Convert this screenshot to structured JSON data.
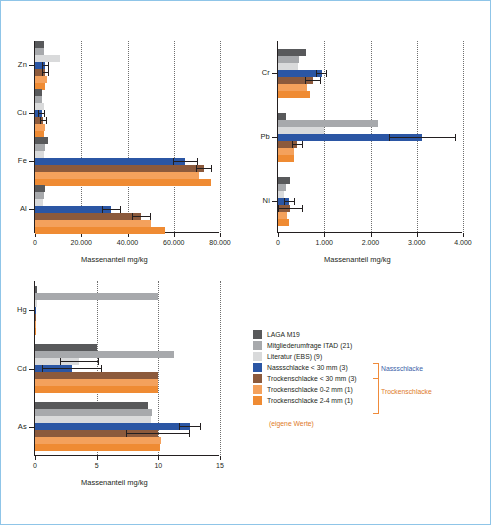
{
  "colors": {
    "dark_gray": "#58595b",
    "mid_gray": "#a7a9ac",
    "light_gray": "#d9dadb",
    "blue": "#2b56a4",
    "brown": "#8c5a3c",
    "orange_light": "#f4a15c",
    "orange": "#ef8b33",
    "hatch_dark": "#6d6e71",
    "brace": "#f08b3a",
    "group_blue": "#3b5fa8",
    "group_orange": "#e07b2a"
  },
  "legend": {
    "items": [
      {
        "label": "LAGA M19",
        "color": "#58595b"
      },
      {
        "label": "Mitgliederumfrage ITAD (21)",
        "color": "#a7a9ac"
      },
      {
        "label": "Literatur (EBS) (9)",
        "color": "#d9dadb"
      },
      {
        "label": "Nassschlacke < 30 mm (3)",
        "color": "#2b56a4"
      },
      {
        "label": "Trockenschlacke < 30 mm (3)",
        "color": "#8c5a3c"
      },
      {
        "label": "Trockenschlacke 0-2 mm (1)",
        "color": "#f4a15c"
      },
      {
        "label": "Trockenschlacke 2-4 mm (1)",
        "color": "#ef8b33"
      }
    ],
    "group_labels": {
      "wet": "Nassschlacke",
      "dry": "Trockenschlacke"
    },
    "note": "(eigene Werte)"
  },
  "chart_data": [
    {
      "type": "bar",
      "id": "chart-top-left",
      "orientation": "horizontal",
      "xlabel": "Massenanteil  mg/kg",
      "ylabel": "",
      "xlim": [
        0,
        80000
      ],
      "xticks": [
        0,
        20000,
        40000,
        60000,
        80000
      ],
      "xticklabels": [
        "0",
        "20.000",
        "40.000",
        "60.000",
        "80.000"
      ],
      "categories": [
        "Zn",
        "Cu",
        "Fe",
        "Al"
      ],
      "grid": true,
      "series": [
        {
          "name": "LAGA M19",
          "color": "#58595b",
          "values": [
            4000,
            3000,
            5500,
            4500
          ]
        },
        {
          "name": "Mitgliederumfrage ITAD (21)",
          "color": "#a7a9ac",
          "values": [
            4000,
            3000,
            4500,
            4000
          ]
        },
        {
          "name": "Literatur (EBS) (9)",
          "color": "#d9dadb",
          "values": [
            11000,
            4000,
            4000,
            3500
          ]
        },
        {
          "name": "Nassschlacke < 30 mm (3)",
          "color": "#2b56a4",
          "values": [
            4500,
            3000,
            65000,
            33000
          ],
          "err": [
            1500,
            1500,
            5500,
            4000
          ]
        },
        {
          "name": "Trockenschlacke < 30 mm (3)",
          "color": "#8c5a3c",
          "values": [
            4500,
            3500,
            73000,
            46000
          ],
          "err": [
            1500,
            1500,
            3500,
            4000
          ]
        },
        {
          "name": "Trockenschlacke 0-2 mm (1)",
          "color": "#f4a15c",
          "values": [
            5000,
            4500,
            71000,
            50000
          ]
        },
        {
          "name": "Trockenschlacke 2-4 mm (1)",
          "color": "#ef8b33",
          "values": [
            4500,
            4000,
            76000,
            56000
          ]
        }
      ]
    },
    {
      "type": "bar",
      "id": "chart-top-right",
      "orientation": "horizontal",
      "xlabel": "Massenanteil  mg/kg",
      "xlim": [
        0,
        4000
      ],
      "xticks": [
        0,
        1000,
        2000,
        3000,
        4000
      ],
      "xticklabels": [
        "0",
        "1.000",
        "2.000",
        "3.000",
        "4.000"
      ],
      "categories": [
        "Cr",
        "Pb",
        "Ni"
      ],
      "grid": true,
      "series": [
        {
          "name": "LAGA M19",
          "color": "#58595b",
          "values": [
            610,
            180,
            250
          ]
        },
        {
          "name": "Mitgliederumfrage ITAD (21)",
          "color": "#a7a9ac",
          "values": [
            460,
            2170,
            170
          ]
        },
        {
          "name": "Literatur (EBS) (9)",
          "color": "#d9dadb",
          "values": [
            430,
            1000,
            120
          ]
        },
        {
          "name": "Nassschlacke < 30 mm (3)",
          "color": "#2b56a4",
          "values": [
            950,
            3120,
            240
          ],
          "err": [
            120,
            730,
            120
          ]
        },
        {
          "name": "Trockenschlacke < 30 mm (3)",
          "color": "#8c5a3c",
          "values": [
            760,
            420,
            270
          ],
          "err": [
            180,
            120,
            270
          ]
        },
        {
          "name": "Trockenschlacke 0-2 mm (1)",
          "color": "#f4a15c",
          "values": [
            620,
            340,
            190
          ]
        },
        {
          "name": "Trockenschlacke 2-4 mm (1)",
          "color": "#ef8b33",
          "values": [
            690,
            340,
            230
          ]
        }
      ]
    },
    {
      "type": "bar",
      "id": "chart-bottom",
      "orientation": "horizontal",
      "xlabel": "Massenanteil  mg/kg",
      "xlim": [
        0,
        15
      ],
      "xticks": [
        0,
        5,
        10,
        15
      ],
      "xticklabels": [
        "0",
        "5",
        "10",
        "15"
      ],
      "categories": [
        "Hg",
        "Cd",
        "As"
      ],
      "grid": true,
      "series": [
        {
          "name": "LAGA M19",
          "color": "#58595b",
          "values": [
            0.2,
            5.0,
            9.2
          ]
        },
        {
          "name": "Mitgliederumfrage ITAD (21)",
          "color": "#a7a9ac",
          "values": [
            10.0,
            11.3,
            9.5
          ]
        },
        {
          "name": "Literatur (EBS) (9)",
          "color": "#d9dadb",
          "values": [
            0.15,
            3.6,
            9.4
          ],
          "err": [
            0,
            1.6,
            0
          ]
        },
        {
          "name": "Nassschlacke < 30 mm (3)",
          "color": "#2b56a4",
          "values": [
            0.1,
            3.0,
            12.6
          ],
          "err": [
            0,
            2.4,
            0.9
          ]
        },
        {
          "name": "Trockenschlacke < 30 mm (3)",
          "color": "#8c5a3c",
          "values": [
            0.1,
            10.0,
            10.0
          ],
          "err": [
            0,
            0,
            2.6
          ]
        },
        {
          "name": "Trockenschlacke 0-2 mm (1)",
          "color": "#f4a15c",
          "values": [
            0.1,
            10.0,
            10.2
          ]
        },
        {
          "name": "Trockenschlacke 2-4 mm (1)",
          "color": "#ef8b33",
          "values": [
            0.1,
            10.0,
            10.1
          ]
        }
      ]
    }
  ]
}
